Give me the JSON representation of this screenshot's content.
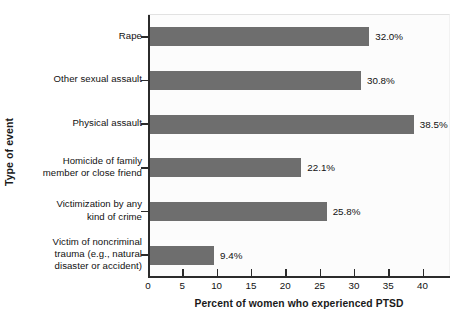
{
  "chart_data": {
    "type": "bar",
    "orientation": "horizontal",
    "title": "",
    "xlabel": "Percent of women who experienced PTSD",
    "ylabel": "Type of event",
    "categories": [
      "Rape",
      "Other sexual assault",
      "Physical assault",
      "Homicide of family member or close friend",
      "Victimization by any kind of crime",
      "Victim of noncriminal trauma (e.g., natural disaster or accident)"
    ],
    "category_lines": [
      [
        "Rape"
      ],
      [
        "Other sexual assault"
      ],
      [
        "Physical assault"
      ],
      [
        "Homicide of family",
        "member or close friend"
      ],
      [
        "Victimization by any",
        "kind of crime"
      ],
      [
        "Victim of noncriminal",
        "trauma (e.g., natural",
        "disaster or accident)"
      ]
    ],
    "values": [
      32.0,
      30.8,
      38.5,
      22.1,
      25.8,
      9.4
    ],
    "value_labels": [
      "32.0%",
      "30.8%",
      "38.5%",
      "22.1%",
      "25.8%",
      "9.4%"
    ],
    "xlim": [
      0,
      44
    ],
    "xticks": [
      0,
      5,
      10,
      15,
      20,
      25,
      30,
      35,
      40
    ],
    "xtick_labels": [
      "0",
      "5",
      "10",
      "15",
      "20",
      "25",
      "30",
      "35",
      "40"
    ],
    "grid": false,
    "legend": "none",
    "bar_color": "#6e6e6e",
    "plot_background": "#fcfcfc",
    "axis_color": "#2b2b2b"
  },
  "caption": ""
}
